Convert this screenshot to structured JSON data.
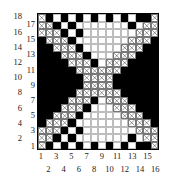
{
  "chart_data": {
    "type": "heatmap",
    "title": "",
    "xlabel": "",
    "ylabel": "",
    "columns": 16,
    "rows": 18,
    "x_tick_labels_odd": [
      "1",
      "3",
      "5",
      "7",
      "9",
      "11",
      "13",
      "15"
    ],
    "x_tick_labels_even": [
      "2",
      "4",
      "6",
      "8",
      "10",
      "12",
      "14",
      "16"
    ],
    "y_tick_labels_even": [
      "18",
      "16",
      "14",
      "12",
      "10",
      "8",
      "6",
      "4",
      "2"
    ],
    "y_tick_labels_odd": [
      "17",
      "15",
      "13",
      "11",
      "9",
      "7",
      "5",
      "3",
      "1"
    ],
    "x_values": [
      1,
      2,
      3,
      4,
      5,
      6,
      7,
      8,
      9,
      10,
      11,
      12,
      13,
      14,
      15,
      16
    ],
    "y_values": [
      1,
      2,
      3,
      4,
      5,
      6,
      7,
      8,
      9,
      10,
      11,
      12,
      13,
      14,
      15,
      16,
      17,
      18
    ],
    "legend": [],
    "grid": true,
    "cell_states": [
      "white",
      "black",
      "crossed"
    ],
    "colors": {
      "black_cell": "#000000",
      "white_cell": "#ffffff",
      "grid_line": "#bdbdbd",
      "border": "#000000",
      "cross_mark": "#333333",
      "label_text": "#1a1a1a",
      "background": "#ffffff"
    },
    "matrix_note": "Rows listed top (y=18) to bottom (y=1); each row has 16 entries for x=1..16. 0=white, 1=black, 2=crossed(X).",
    "matrix": [
      [
        2,
        1,
        0,
        1,
        0,
        1,
        0,
        1,
        0,
        1,
        0,
        1,
        0,
        1,
        1,
        2
      ],
      [
        2,
        2,
        1,
        0,
        1,
        0,
        0,
        0,
        0,
        0,
        0,
        0,
        1,
        0,
        2,
        2
      ],
      [
        2,
        2,
        2,
        1,
        0,
        1,
        0,
        0,
        0,
        0,
        0,
        0,
        0,
        2,
        2,
        2
      ],
      [
        1,
        2,
        2,
        2,
        1,
        0,
        0,
        0,
        0,
        0,
        0,
        0,
        2,
        2,
        2,
        1
      ],
      [
        1,
        1,
        2,
        2,
        2,
        1,
        0,
        0,
        0,
        0,
        0,
        2,
        2,
        2,
        1,
        1
      ],
      [
        1,
        1,
        1,
        2,
        2,
        2,
        1,
        0,
        0,
        0,
        2,
        2,
        2,
        1,
        1,
        1
      ],
      [
        1,
        1,
        1,
        1,
        2,
        2,
        2,
        1,
        0,
        2,
        2,
        2,
        1,
        1,
        1,
        1
      ],
      [
        1,
        1,
        1,
        1,
        1,
        2,
        2,
        2,
        2,
        2,
        2,
        1,
        1,
        1,
        1,
        1
      ],
      [
        1,
        1,
        1,
        1,
        1,
        1,
        2,
        2,
        2,
        2,
        1,
        1,
        1,
        1,
        1,
        1
      ],
      [
        1,
        1,
        1,
        1,
        1,
        1,
        2,
        2,
        2,
        2,
        1,
        1,
        1,
        1,
        1,
        1
      ],
      [
        1,
        1,
        1,
        1,
        1,
        2,
        2,
        2,
        2,
        2,
        2,
        1,
        1,
        1,
        1,
        1
      ],
      [
        1,
        1,
        1,
        1,
        2,
        2,
        2,
        1,
        0,
        2,
        2,
        2,
        1,
        1,
        1,
        1
      ],
      [
        1,
        1,
        1,
        2,
        2,
        2,
        1,
        0,
        0,
        0,
        2,
        2,
        2,
        1,
        1,
        1
      ],
      [
        1,
        1,
        2,
        2,
        2,
        1,
        0,
        0,
        0,
        0,
        0,
        2,
        2,
        2,
        1,
        1
      ],
      [
        1,
        2,
        2,
        2,
        1,
        0,
        0,
        0,
        0,
        0,
        0,
        0,
        2,
        2,
        2,
        1
      ],
      [
        2,
        2,
        2,
        1,
        0,
        1,
        0,
        0,
        0,
        0,
        0,
        0,
        0,
        2,
        2,
        2
      ],
      [
        2,
        2,
        1,
        0,
        1,
        0,
        0,
        0,
        0,
        0,
        0,
        0,
        1,
        0,
        2,
        2
      ],
      [
        2,
        1,
        0,
        1,
        0,
        1,
        0,
        1,
        0,
        1,
        0,
        1,
        0,
        1,
        1,
        2
      ]
    ]
  }
}
